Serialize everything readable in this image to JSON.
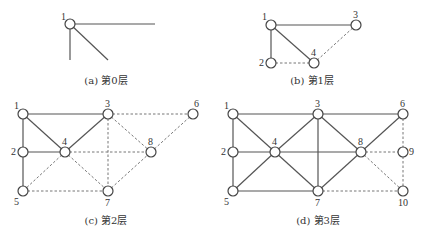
{
  "figure": {
    "panels": [
      {
        "id": "a",
        "caption": "(a) 第0层",
        "caption_pos": [
          106,
          84
        ],
        "nodes": [
          {
            "id": "1",
            "x": 70,
            "y": 24,
            "lx": -9,
            "ly": -4
          }
        ],
        "edges": [],
        "stubs": [
          {
            "from": "1",
            "to": [
              155,
              24
            ],
            "style": "solid"
          },
          {
            "from": "1",
            "to": [
              70,
              60
            ],
            "style": "solid"
          },
          {
            "from": "1",
            "to": [
              108,
              60
            ],
            "style": "solid"
          }
        ]
      },
      {
        "id": "b",
        "caption": "(b) 第1层",
        "caption_pos": [
          312,
          84
        ],
        "nodes": [
          {
            "id": "1",
            "x": 271,
            "y": 25,
            "lx": -9,
            "ly": -5
          },
          {
            "id": "3",
            "x": 356,
            "y": 25,
            "lx": -3,
            "ly": -7
          },
          {
            "id": "2",
            "x": 271,
            "y": 63,
            "lx": -12,
            "ly": 3
          },
          {
            "id": "4",
            "x": 314,
            "y": 63,
            "lx": -3,
            "ly": -7
          }
        ],
        "edges": [
          {
            "from": "1",
            "to": "3",
            "style": "solid"
          },
          {
            "from": "1",
            "to": "2",
            "style": "solid"
          },
          {
            "from": "1",
            "to": "4",
            "style": "solid"
          },
          {
            "from": "2",
            "to": "4",
            "style": "dashed"
          },
          {
            "from": "4",
            "to": "3",
            "style": "dashed"
          }
        ],
        "stubs": []
      },
      {
        "id": "c",
        "caption": "(c) 第2层",
        "caption_pos": [
          106,
          224
        ],
        "nodes": [
          {
            "id": "1",
            "x": 23,
            "y": 114,
            "lx": -9,
            "ly": -5
          },
          {
            "id": "3",
            "x": 108,
            "y": 114,
            "lx": -3,
            "ly": -7
          },
          {
            "id": "6",
            "x": 193,
            "y": 114,
            "lx": 1,
            "ly": -7
          },
          {
            "id": "2",
            "x": 23,
            "y": 152,
            "lx": -12,
            "ly": 3
          },
          {
            "id": "4",
            "x": 65,
            "y": 152,
            "lx": -3,
            "ly": -7
          },
          {
            "id": "8",
            "x": 151,
            "y": 152,
            "lx": -3,
            "ly": -7
          },
          {
            "id": "5",
            "x": 23,
            "y": 191,
            "lx": -9,
            "ly": 14
          },
          {
            "id": "7",
            "x": 108,
            "y": 191,
            "lx": -3,
            "ly": 15
          }
        ],
        "edges": [
          {
            "from": "1",
            "to": "3",
            "style": "solid"
          },
          {
            "from": "1",
            "to": "2",
            "style": "solid"
          },
          {
            "from": "2",
            "to": "5",
            "style": "solid"
          },
          {
            "from": "1",
            "to": "4",
            "style": "solid"
          },
          {
            "from": "3",
            "to": "4",
            "style": "solid"
          },
          {
            "from": "2",
            "to": "4",
            "style": "solid"
          },
          {
            "from": "3",
            "to": "6",
            "style": "dashed"
          },
          {
            "from": "3",
            "to": "7",
            "style": "dashed"
          },
          {
            "from": "3",
            "to": "8",
            "style": "dashed"
          },
          {
            "from": "6",
            "to": "8",
            "style": "dashed"
          },
          {
            "from": "4",
            "to": "8",
            "style": "dashed"
          },
          {
            "from": "4",
            "to": "5",
            "style": "dashed"
          },
          {
            "from": "4",
            "to": "7",
            "style": "dashed"
          },
          {
            "from": "5",
            "to": "7",
            "style": "dashed"
          },
          {
            "from": "7",
            "to": "8",
            "style": "dashed"
          }
        ],
        "stubs": []
      },
      {
        "id": "d",
        "caption": "(d) 第3层",
        "caption_pos": [
          318,
          224
        ],
        "nodes": [
          {
            "id": "1",
            "x": 233,
            "y": 114,
            "lx": -9,
            "ly": -5
          },
          {
            "id": "3",
            "x": 318,
            "y": 114,
            "lx": -3,
            "ly": -7
          },
          {
            "id": "6",
            "x": 403,
            "y": 114,
            "lx": -3,
            "ly": -7
          },
          {
            "id": "2",
            "x": 233,
            "y": 152,
            "lx": -12,
            "ly": 3
          },
          {
            "id": "4",
            "x": 275,
            "y": 152,
            "lx": -3,
            "ly": -7
          },
          {
            "id": "8",
            "x": 361,
            "y": 152,
            "lx": -3,
            "ly": -7
          },
          {
            "id": "9",
            "x": 403,
            "y": 152,
            "lx": 6,
            "ly": 3
          },
          {
            "id": "5",
            "x": 233,
            "y": 191,
            "lx": -9,
            "ly": 14
          },
          {
            "id": "7",
            "x": 318,
            "y": 191,
            "lx": -3,
            "ly": 15
          },
          {
            "id": "10",
            "x": 403,
            "y": 191,
            "lx": -5,
            "ly": 15
          }
        ],
        "edges": [
          {
            "from": "1",
            "to": "3",
            "style": "solid"
          },
          {
            "from": "3",
            "to": "6",
            "style": "solid"
          },
          {
            "from": "1",
            "to": "2",
            "style": "solid"
          },
          {
            "from": "2",
            "to": "5",
            "style": "solid"
          },
          {
            "from": "1",
            "to": "4",
            "style": "solid"
          },
          {
            "from": "3",
            "to": "4",
            "style": "solid"
          },
          {
            "from": "2",
            "to": "4",
            "style": "solid"
          },
          {
            "from": "4",
            "to": "5",
            "style": "solid"
          },
          {
            "from": "4",
            "to": "7",
            "style": "solid"
          },
          {
            "from": "4",
            "to": "8",
            "style": "solid"
          },
          {
            "from": "3",
            "to": "7",
            "style": "solid"
          },
          {
            "from": "3",
            "to": "8",
            "style": "solid"
          },
          {
            "from": "6",
            "to": "8",
            "style": "solid"
          },
          {
            "from": "7",
            "to": "8",
            "style": "solid"
          },
          {
            "from": "5",
            "to": "7",
            "style": "solid"
          },
          {
            "from": "6",
            "to": "9",
            "style": "dashed"
          },
          {
            "from": "9",
            "to": "10",
            "style": "dashed"
          },
          {
            "from": "8",
            "to": "9",
            "style": "dashed"
          },
          {
            "from": "8",
            "to": "10",
            "style": "dashed"
          },
          {
            "from": "7",
            "to": "10",
            "style": "dashed"
          }
        ],
        "stubs": []
      }
    ],
    "node_radius": 5,
    "colors": {
      "solid_edge": "#555555",
      "dashed_edge": "#777777",
      "node_stroke": "#444444",
      "text": "#333333",
      "background": "#ffffff"
    }
  }
}
